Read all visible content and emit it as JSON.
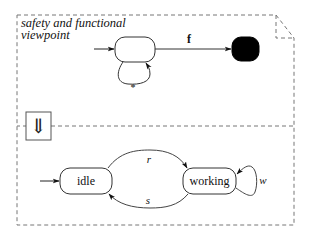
{
  "title": "safety and functional",
  "title_line2": "viewpoint",
  "refinement_symbol": "⇓",
  "upper": {
    "transition_f": "f",
    "self_loop_label": "*"
  },
  "lower": {
    "states": [
      {
        "id": "idle",
        "label": "idle"
      },
      {
        "id": "working",
        "label": "working"
      }
    ],
    "transitions": [
      {
        "from": "idle",
        "to": "working",
        "label": "r"
      },
      {
        "from": "working",
        "to": "idle",
        "label": "s"
      },
      {
        "from": "working",
        "to": "working",
        "label": "w"
      }
    ]
  },
  "colors": {
    "stroke": "#333333",
    "dash": "#666666",
    "final_state_fill": "#000000",
    "background": "#ffffff"
  }
}
